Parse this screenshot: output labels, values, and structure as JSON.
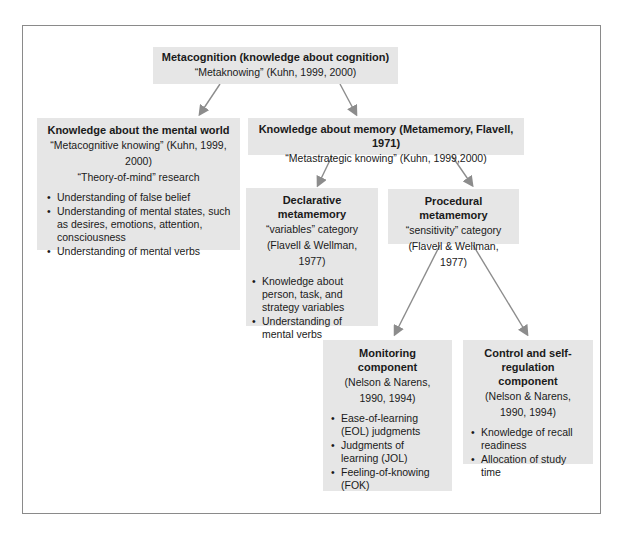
{
  "root": {
    "title": "Metacognition (knowledge about cognition)",
    "subtitle": "“Metaknowing”  (Kuhn, 1999, 2000)"
  },
  "mental_world": {
    "title": "Knowledge about the mental world",
    "subtitle1": "“Metacognitive knowing” (Kuhn, 1999, 2000)",
    "subtitle2": "“Theory-of-mind” research",
    "items": [
      "Understanding of false belief",
      "Understanding of mental states, such as desires, emotions, attention, consciousness",
      "Understanding of mental verbs"
    ]
  },
  "memory": {
    "title": "Knowledge about memory (Metamemory, Flavell, 1971)",
    "subtitle": "“Metastrategic knowing” (Kuhn, 1999,2000)"
  },
  "declarative": {
    "title": "Declarative metamemory",
    "subtitle1": "“variables” category",
    "subtitle2": "(Flavell & Wellman, 1977)",
    "items": [
      "Knowledge about person, task, and strategy variables",
      "Understanding of mental verbs"
    ]
  },
  "procedural": {
    "title": "Procedural metamemory",
    "subtitle1": "“sensitivity” category",
    "subtitle2": "(Flavell & Wellman, 1977)"
  },
  "monitoring": {
    "title": "Monitoring component",
    "subtitle": "(Nelson & Narens, 1990, 1994)",
    "items": [
      "Ease-of-learning (EOL) judgments",
      "Judgments of learning (JOL)",
      "Feeling-of-knowing (FOK)"
    ]
  },
  "control": {
    "title": "Control and self-regulation component",
    "subtitle": "(Nelson & Narens, 1990, 1994)",
    "items": [
      "Knowledge of recall readiness",
      "Allocation of study time"
    ]
  },
  "colors": {
    "box_fill": "#e6e6e6",
    "arrow": "#8c8c8c",
    "frame": "#8a8a8a"
  }
}
